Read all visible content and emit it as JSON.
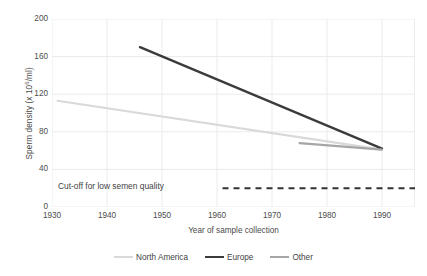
{
  "chart_data": {
    "type": "line",
    "title": "",
    "xlabel": "Year of sample collection",
    "ylabel": "Sperm density (x 10⁶/ml)",
    "ylabel_prefix": "Sperm density (x 10",
    "ylabel_sup": "6",
    "ylabel_suffix": "/ml)",
    "xlim": [
      1930,
      1996
    ],
    "ylim": [
      0,
      200
    ],
    "xticks": [
      1930,
      1940,
      1950,
      1960,
      1970,
      1980,
      1990
    ],
    "yticks": [
      0,
      40,
      80,
      120,
      160,
      200
    ],
    "grid": true,
    "legend_position": "bottom",
    "series": [
      {
        "name": "North America",
        "color": "#d9d9d9",
        "width": 2.1,
        "x": [
          1931,
          1990
        ],
        "y": [
          113,
          61
        ]
      },
      {
        "name": "Europe",
        "color": "#3b3b3b",
        "width": 2.4,
        "x": [
          1946,
          1990
        ],
        "y": [
          170,
          62
        ]
      },
      {
        "name": "Other",
        "color": "#a6a6a6",
        "width": 2.1,
        "x": [
          1975,
          1990
        ],
        "y": [
          68,
          61
        ]
      }
    ],
    "reference_line": {
      "label": "Cut-off for low semen quality",
      "value": 20,
      "x_start": 1961,
      "x_end": 1996,
      "style": "dashed",
      "color": "#333333"
    }
  },
  "legend": {
    "items": [
      {
        "label": "North America",
        "color": "#d9d9d9",
        "width": "2.2px"
      },
      {
        "label": "Europe",
        "color": "#3b3b3b",
        "width": "2.6px"
      },
      {
        "label": "Other",
        "color": "#a6a6a6",
        "width": "2.2px"
      }
    ]
  },
  "colors": {
    "grid": "#ebebeb",
    "axis_text": "#4d4d4d",
    "background": "#ffffff"
  }
}
